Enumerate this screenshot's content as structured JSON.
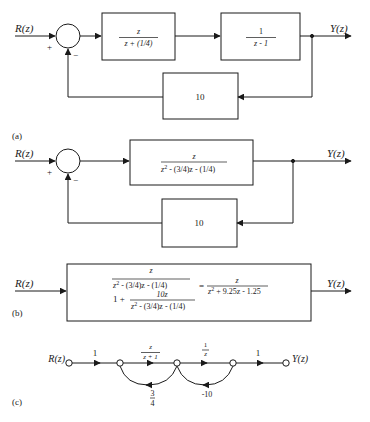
{
  "diagram_a": {
    "label": "(a)",
    "input": "R(z)",
    "output": "Y(z)",
    "plus_sign": "+",
    "minus_sign": "−",
    "block1": {
      "num": "z",
      "den": "z + (1/4)"
    },
    "block2": {
      "num": "1",
      "den": "z - 1"
    },
    "feedback": "10"
  },
  "diagram_b1": {
    "input": "R(z)",
    "output": "Y(z)",
    "plus_sign": "+",
    "minus_sign": "−",
    "block": {
      "num": "z",
      "den_main": "z",
      "den_sup": "2",
      "den_rest": " - (3/4)z - (1/4)"
    },
    "feedback": "10"
  },
  "diagram_b2": {
    "label": "(b)",
    "input": "R(z)",
    "output": "Y(z)",
    "left_num": {
      "num": "z",
      "den_main": "z",
      "den_sup": "2",
      "den_rest": " - (3/4)z - (1/4)"
    },
    "left_den_prefix": "1 +",
    "left_den_frac": {
      "num": "10z",
      "den_main": "z",
      "den_sup": "2",
      "den_rest": " - (3/4)z - (1/4)"
    },
    "equals": "=",
    "result": {
      "num": "z",
      "den_main": "z",
      "den_sup": "2",
      "den_rest": " + 9.25z - 1.25"
    }
  },
  "diagram_c": {
    "label": "(c)",
    "input": "R(z)",
    "output": "Y(z)",
    "branches": [
      {
        "gain": "1"
      },
      {
        "gain_num": "z",
        "gain_den": "z + 1"
      },
      {
        "gain_num": "1",
        "gain_den": "z"
      },
      {
        "gain": "1"
      }
    ],
    "feedback_1": {
      "num": "3",
      "den": "4"
    },
    "feedback_2": "-10"
  }
}
